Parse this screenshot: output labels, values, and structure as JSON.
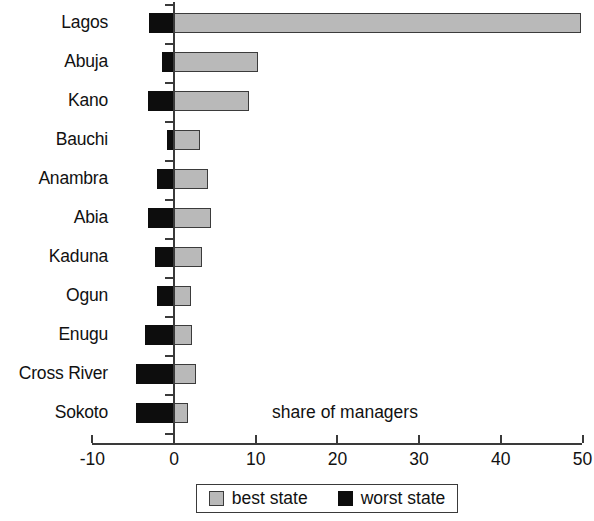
{
  "chart_data": {
    "type": "bar",
    "title": "",
    "subtitle": "",
    "xlabel": "share of managers",
    "ylabel": "",
    "orientation": "horizontal",
    "grid": false,
    "legend_position": "bottom",
    "xlim": [
      -10,
      50
    ],
    "xticks": [
      -10,
      0,
      10,
      20,
      30,
      40,
      50
    ],
    "xtick_labels": [
      "-10",
      "0",
      "10",
      "20",
      "30",
      "40",
      "50"
    ],
    "categories": [
      "Lagos",
      "Abuja",
      "Kano",
      "Bauchi",
      "Anambra",
      "Abia",
      "Kaduna",
      "Ogun",
      "Enugu",
      "Cross River",
      "Sokoto"
    ],
    "series": [
      {
        "name": "best state",
        "color": "#b9b9b9",
        "values": [
          49.8,
          10.3,
          9.2,
          3.2,
          4.2,
          4.5,
          3.4,
          2.1,
          2.2,
          2.7,
          1.7
        ]
      },
      {
        "name": "worst state",
        "color": "#0d0d0d",
        "values": [
          -3.0,
          -1.5,
          -3.2,
          -0.8,
          -2.1,
          -3.2,
          -2.3,
          -2.1,
          -3.5,
          -4.6,
          -4.6
        ]
      }
    ],
    "annotations": [
      {
        "text": "share of managers",
        "x": 12,
        "y_row": 10
      }
    ]
  },
  "legend": {
    "items": [
      {
        "label": "best state",
        "swatch": "best"
      },
      {
        "label": "worst state",
        "swatch": "worst"
      }
    ]
  }
}
